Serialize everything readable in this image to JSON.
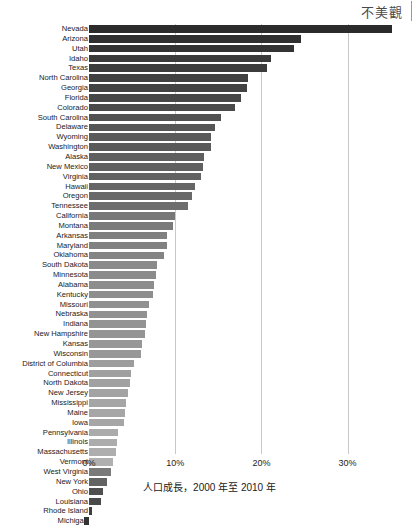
{
  "annotation": {
    "text": "不美觀"
  },
  "axis": {
    "tick_labels": [
      "0%",
      "10%",
      "20%",
      "30%"
    ],
    "tick_values": [
      0,
      10,
      20,
      30
    ]
  },
  "chart_data": {
    "type": "bar",
    "orientation": "horizontal",
    "title": "",
    "subtitle": "",
    "xlabel": "人口成長，2000 年至 2010 年",
    "ylabel": "",
    "xlim": [
      0,
      35.5
    ],
    "grid": true,
    "gridlines_x": [
      10,
      20,
      30
    ],
    "legend": null,
    "annotations": [
      "不美觀"
    ],
    "sort": "descending",
    "colormap": "grayscale-by-value",
    "categories": [
      "Nevada",
      "Arizona",
      "Utah",
      "Idaho",
      "Texas",
      "North Carolina",
      "Georgia",
      "Florida",
      "Colorado",
      "South Carolina",
      "Delaware",
      "Wyoming",
      "Washington",
      "Alaska",
      "New Mexico",
      "Virginia",
      "Hawaii",
      "Oregon",
      "Tennessee",
      "California",
      "Montana",
      "Arkansas",
      "Maryland",
      "Oklahoma",
      "South Dakota",
      "Minnesota",
      "Alabama",
      "Kentucky",
      "Missouri",
      "Nebraska",
      "Indiana",
      "New Hampshire",
      "Kansas",
      "Wisconsin",
      "District of Columbia",
      "Connecticut",
      "North Dakota",
      "New Jersey",
      "Mississippi",
      "Maine",
      "Iowa",
      "Pennsylvania",
      "Illinois",
      "Massachusetts",
      "Vermont",
      "West Virginia",
      "New York",
      "Ohio",
      "Louisiana",
      "Rhode Island",
      "Michigan"
    ],
    "values": [
      35.1,
      24.6,
      23.8,
      21.1,
      20.6,
      18.5,
      18.3,
      17.6,
      16.9,
      15.3,
      14.6,
      14.1,
      14.1,
      13.3,
      13.2,
      13.0,
      12.3,
      12.0,
      11.5,
      10.0,
      9.7,
      9.1,
      9.0,
      8.7,
      7.9,
      7.8,
      7.5,
      7.4,
      7.0,
      6.7,
      6.6,
      6.5,
      6.1,
      6.0,
      5.2,
      4.9,
      4.7,
      4.5,
      4.3,
      4.2,
      4.1,
      3.4,
      3.3,
      3.1,
      2.8,
      2.5,
      2.1,
      1.6,
      1.4,
      0.4,
      -0.6
    ],
    "value_unit": "%"
  },
  "bar_colors": [
    "#2b2b2b",
    "#2f2f2f",
    "#333333",
    "#3a3a3a",
    "#3c3c3c",
    "#414141",
    "#434343",
    "#474747",
    "#4a4a4a",
    "#525252",
    "#565656",
    "#5a5a5a",
    "#5a5a5a",
    "#5f5f5f",
    "#606060",
    "#626262",
    "#666666",
    "#696969",
    "#6d6d6d",
    "#787878",
    "#7b7b7b",
    "#808080",
    "#818181",
    "#848484",
    "#8a8a8a",
    "#8b8b8b",
    "#8d8d8d",
    "#8e8e8e",
    "#909090",
    "#929292",
    "#939393",
    "#949494",
    "#979797",
    "#989898",
    "#9d9d9d",
    "#a0a0a0",
    "#a1a1a1",
    "#a3a3a3",
    "#a5a5a5",
    "#a6a6a6",
    "#a6a6a6",
    "#ababab",
    "#acacac",
    "#aeaeae",
    "#b0b0b0",
    "#7a7a7a",
    "#636363",
    "#4f4f4f",
    "#4a4a4a",
    "#3e3e3e",
    "#333333"
  ]
}
